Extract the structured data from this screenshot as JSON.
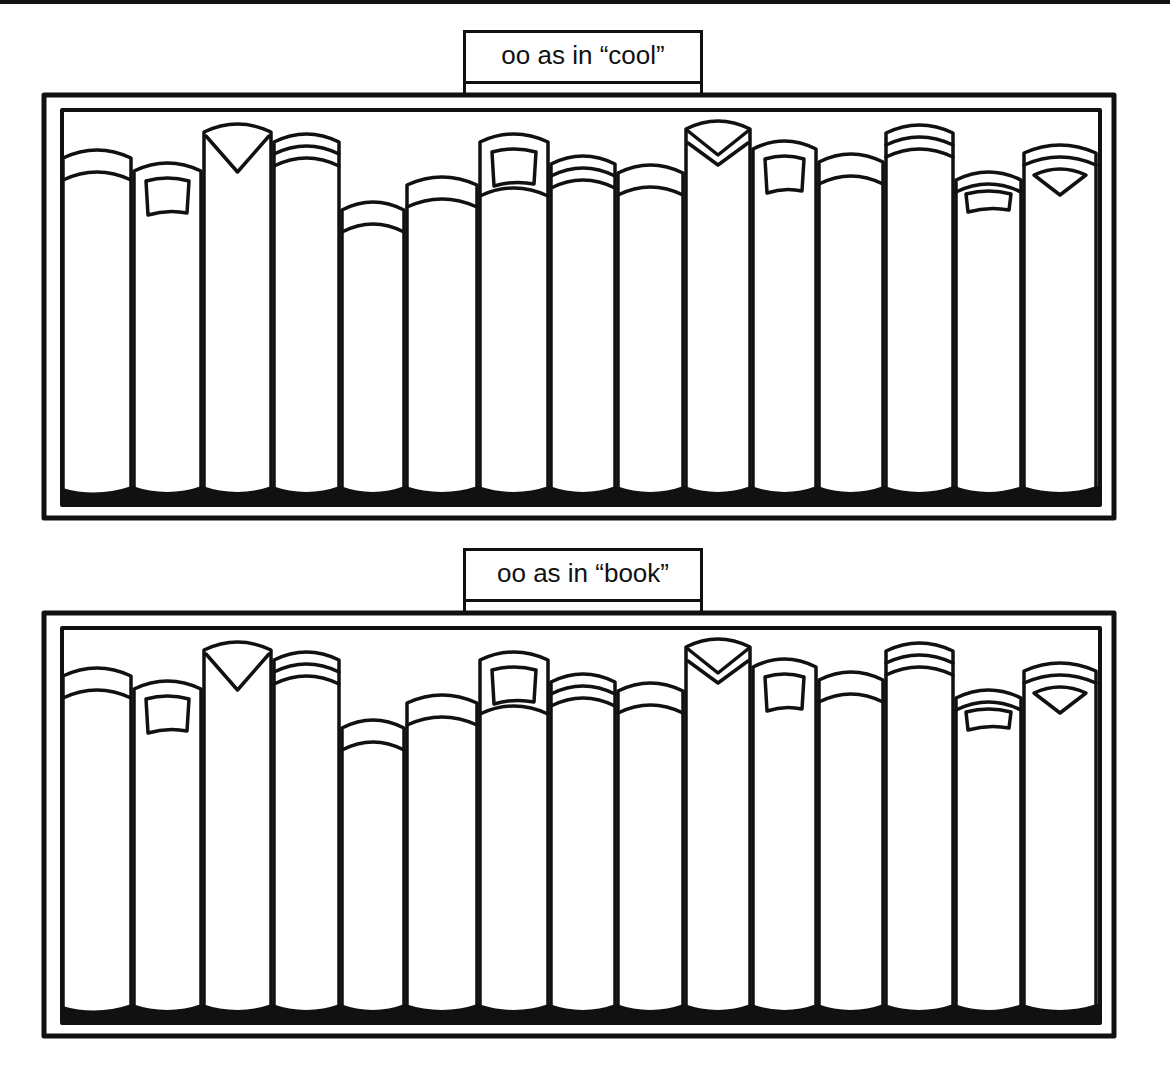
{
  "worksheet": {
    "shelves": [
      {
        "label": "oo as in “cool”",
        "book_count": 15,
        "books": [
          {
            "index": 1,
            "decoration": "double-band"
          },
          {
            "index": 2,
            "decoration": "label-box"
          },
          {
            "index": 3,
            "decoration": "v-notch"
          },
          {
            "index": 4,
            "decoration": "triple-band"
          },
          {
            "index": 5,
            "decoration": "double-band"
          },
          {
            "index": 6,
            "decoration": "double-band"
          },
          {
            "index": 7,
            "decoration": "label-box"
          },
          {
            "index": 8,
            "decoration": "triple-band"
          },
          {
            "index": 9,
            "decoration": "double-band"
          },
          {
            "index": 10,
            "decoration": "v-chevron"
          },
          {
            "index": 11,
            "decoration": "label-box"
          },
          {
            "index": 12,
            "decoration": "double-band"
          },
          {
            "index": 13,
            "decoration": "triple-band"
          },
          {
            "index": 14,
            "decoration": "small-label-box"
          },
          {
            "index": 15,
            "decoration": "triangle-badge"
          }
        ]
      },
      {
        "label": "oo as in “book”",
        "book_count": 15,
        "books": [
          {
            "index": 1,
            "decoration": "double-band"
          },
          {
            "index": 2,
            "decoration": "label-box"
          },
          {
            "index": 3,
            "decoration": "v-notch"
          },
          {
            "index": 4,
            "decoration": "triple-band"
          },
          {
            "index": 5,
            "decoration": "double-band"
          },
          {
            "index": 6,
            "decoration": "double-band"
          },
          {
            "index": 7,
            "decoration": "label-box"
          },
          {
            "index": 8,
            "decoration": "triple-band"
          },
          {
            "index": 9,
            "decoration": "double-band"
          },
          {
            "index": 10,
            "decoration": "v-chevron"
          },
          {
            "index": 11,
            "decoration": "label-box"
          },
          {
            "index": 12,
            "decoration": "double-band"
          },
          {
            "index": 13,
            "decoration": "triple-band"
          },
          {
            "index": 14,
            "decoration": "small-label-box"
          },
          {
            "index": 15,
            "decoration": "triangle-badge"
          }
        ]
      }
    ],
    "colors": {
      "ink": "#111111",
      "paper": "#ffffff"
    }
  }
}
